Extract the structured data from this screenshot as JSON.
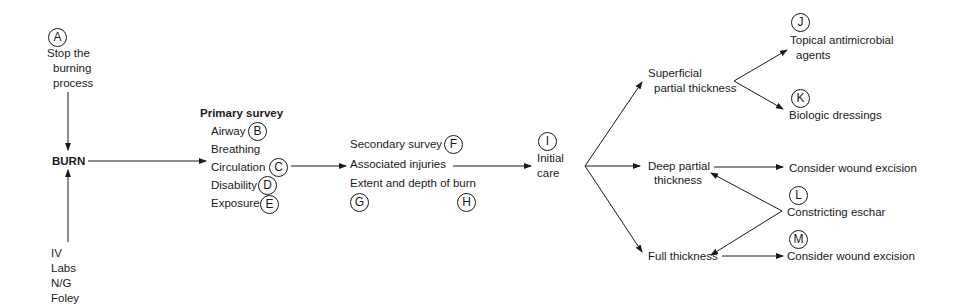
{
  "diagram": {
    "start": {
      "label": "A",
      "text": [
        "Stop the",
        "burning",
        "process"
      ]
    },
    "center": {
      "text": "BURN"
    },
    "support": {
      "items": [
        "IV",
        "Labs",
        "N/G",
        "Foley"
      ]
    },
    "primary_survey": {
      "heading": "Primary survey",
      "items": [
        {
          "text": "Airway",
          "label": "B"
        },
        {
          "text": "Breathing",
          "label": ""
        },
        {
          "text": "Circulation",
          "label": "C"
        },
        {
          "text": "Disability",
          "label": "D"
        },
        {
          "text": "Exposure",
          "label": "E"
        }
      ]
    },
    "secondary_survey": {
      "items": [
        {
          "text": "Secondary survey",
          "label": "F"
        },
        {
          "text": "Associated injuries",
          "label": ""
        },
        {
          "text": "Extent and depth of burn",
          "label": ""
        }
      ],
      "sub_labels": [
        "G",
        "H"
      ]
    },
    "initial_care": {
      "label": "I",
      "text": [
        "Initial",
        "care"
      ]
    },
    "depths": {
      "superficial": [
        "Superficial",
        "partial thickness"
      ],
      "deep": [
        "Deep partial",
        "thickness"
      ],
      "full": "Full thickness"
    },
    "outcomes": {
      "topical": {
        "label": "J",
        "text": [
          "Topical antimicrobial",
          "agents"
        ]
      },
      "biologic": {
        "label": "K",
        "text": "Biologic dressings"
      },
      "deep_excision": {
        "text": "Consider wound excision"
      },
      "eschar": {
        "label": "L",
        "text": "Constricting eschar"
      },
      "full_excision": {
        "label": "M",
        "text": "Consider wound excision"
      }
    },
    "colors": {
      "ink": "#1a1a1a",
      "background": "#ffffff"
    }
  }
}
